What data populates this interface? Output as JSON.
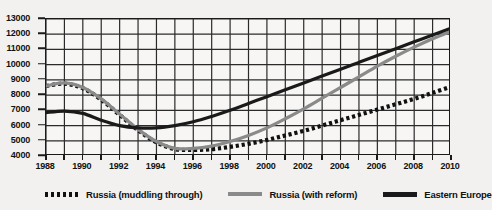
{
  "chart_data": {
    "type": "line",
    "title": "",
    "xlabel": "",
    "ylabel": "",
    "xlim": [
      1988,
      2010
    ],
    "ylim": [
      4000,
      13000
    ],
    "ytick_step": 1000,
    "xtick_step": 1,
    "xlabel_step": 2,
    "grid": true,
    "legend_position": "bottom",
    "yticks": [
      13000,
      12000,
      11000,
      10000,
      9000,
      8000,
      7000,
      6000,
      5000,
      4000
    ],
    "xticks": [
      1988,
      1989,
      1990,
      1991,
      1992,
      1993,
      1994,
      1995,
      1996,
      1997,
      1998,
      1999,
      2000,
      2001,
      2002,
      2003,
      2004,
      2005,
      2006,
      2007,
      2008,
      2009,
      2010
    ],
    "xtick_labels": [
      1988,
      1990,
      1992,
      1994,
      1996,
      1998,
      2000,
      2002,
      2004,
      2006,
      2008,
      2010
    ],
    "x": [
      1988,
      1989,
      1990,
      1991,
      1992,
      1993,
      1994,
      1995,
      1996,
      1997,
      1998,
      1999,
      2000,
      2001,
      2002,
      2003,
      2004,
      2005,
      2006,
      2007,
      2008,
      2009,
      2010
    ],
    "series": [
      {
        "name": "Russia (muddling through)",
        "style": "dotted",
        "color": "#111111",
        "values": [
          8600,
          8750,
          8450,
          7700,
          6700,
          5700,
          4900,
          4450,
          4400,
          4450,
          4600,
          4800,
          5050,
          5350,
          5650,
          6000,
          6350,
          6700,
          7050,
          7400,
          7750,
          8150,
          8550
        ]
      },
      {
        "name": "Russia (with reform)",
        "style": "solid",
        "color": "#8a8a8a",
        "values": [
          8600,
          8800,
          8500,
          7750,
          6750,
          5750,
          4950,
          4500,
          4500,
          4650,
          4950,
          5350,
          5850,
          6450,
          7100,
          7800,
          8500,
          9200,
          9900,
          10550,
          11150,
          11700,
          12200
        ]
      },
      {
        "name": "Eastern Europe",
        "style": "solid",
        "color": "#1a1a1a",
        "values": [
          6850,
          6950,
          6800,
          6350,
          6000,
          5850,
          5850,
          6000,
          6250,
          6600,
          7000,
          7450,
          7900,
          8350,
          8800,
          9250,
          9700,
          10150,
          10600,
          11050,
          11500,
          11950,
          12400
        ]
      }
    ]
  },
  "legend": {
    "items": [
      {
        "label": "Russia (muddling through)",
        "swatch": "dotted-black"
      },
      {
        "label": "Russia (with reform)",
        "swatch": "solid-gray"
      },
      {
        "label": "Eastern Europe",
        "swatch": "solid-black"
      }
    ]
  },
  "colors": {
    "background": "#f2f1ef",
    "plot_background": "#f7f6f4",
    "grid": "#2b2b2b",
    "axis": "#1a1a1a",
    "series_muddling": "#111111",
    "series_reform": "#8a8a8a",
    "series_eastern_europe": "#1a1a1a"
  }
}
